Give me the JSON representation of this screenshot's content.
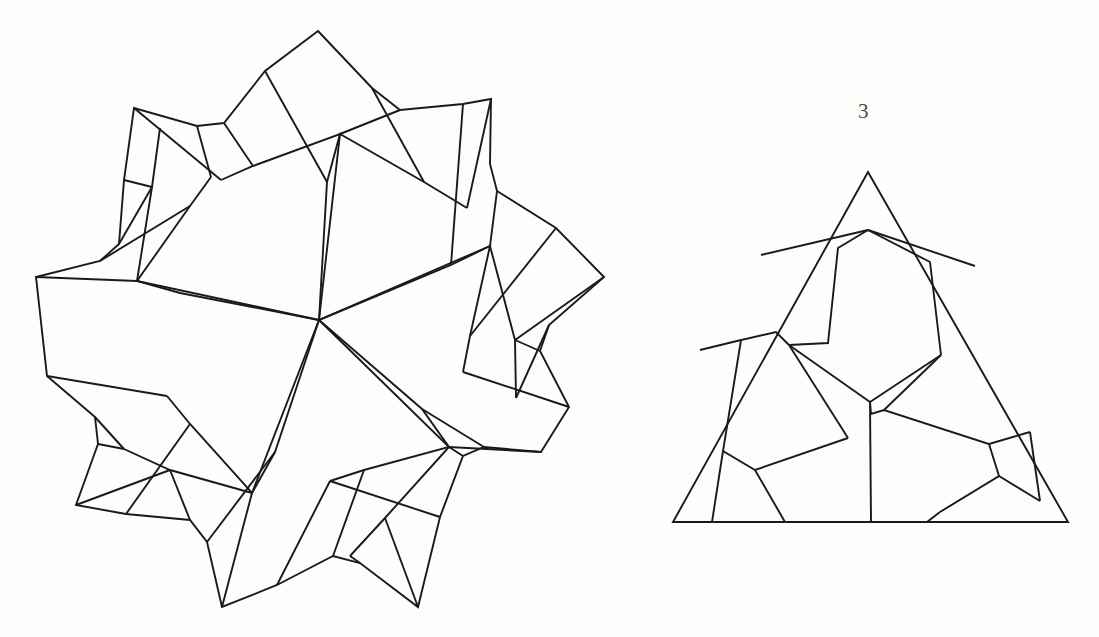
{
  "page": {
    "width": 1099,
    "height": 637,
    "background_color": "#fdfdfb",
    "ink_color": "#1a1a1a",
    "label_color": "#4a4a4a",
    "stroke_width": 1.9,
    "figure_count": 2
  },
  "labels": {
    "triangle_number": "3"
  },
  "figures": [
    {
      "name": "star-rosette",
      "title": "",
      "shape": "ten-pointed star rosette",
      "symmetry_order": 5,
      "center": {
        "x": 319,
        "y": 320
      },
      "outer_radius": 290,
      "bounds": {
        "left": 36,
        "top": 31,
        "right": 603,
        "bottom": 608
      },
      "pieces": 10,
      "has_label": false
    },
    {
      "name": "triangle-dissection",
      "title": "3",
      "shape": "equilateral triangle",
      "symmetry_order": 3,
      "center": {
        "x": 870,
        "y": 405
      },
      "bounds": {
        "left": 673,
        "top": 172,
        "right": 1068,
        "bottom": 522
      },
      "vertices": [
        {
          "x": 868,
          "y": 172
        },
        {
          "x": 1068,
          "y": 522
        },
        {
          "x": 673,
          "y": 522
        }
      ],
      "pieces": 6,
      "has_label": true
    }
  ],
  "geometry": {
    "star": {
      "outer_boundary": "M 318 31 L 384 96 L 404 109 L 468 104 L 491 100 L 490 162 L 491 185 L 549 224 L 568 236 L 527 281 L 517 300 L 549 355 L 565 377 L 503 401 L 484 413 L 486 477 L 483 499 L 422 478 L 401 476 L 365 529 L 352 549 L 306 507 L 287 497 L 231 525 L 210 535 L 204 473 L 197 452 L 135 442 L 113 437 L 143 383 L 147 362 L 102 318 L 86 302 L 143 277 L 159 263 L 152 200 L 151 178 L 214 192 L 236 191 L 266 135 L 278 114 Z",
      "note": "Approximate traced outline of the ten-pointed outer boundary with notched tips."
    },
    "triangle": {
      "outline": "M 868 172 L 1068 522 L 673 522 Z",
      "center_node": {
        "x": 870,
        "y": 402
      }
    }
  }
}
